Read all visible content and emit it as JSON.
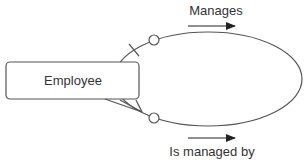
{
  "diagram": {
    "type": "recursive-relationship",
    "entity": {
      "label": "Employee"
    },
    "relationship_top": {
      "label": "Manages",
      "cardinality": "zero-or-one"
    },
    "relationship_bottom": {
      "label": "Is managed by",
      "cardinality": "zero-or-many"
    }
  },
  "colors": {
    "stroke": "#555555",
    "text": "#333333",
    "background": "#ffffff"
  }
}
